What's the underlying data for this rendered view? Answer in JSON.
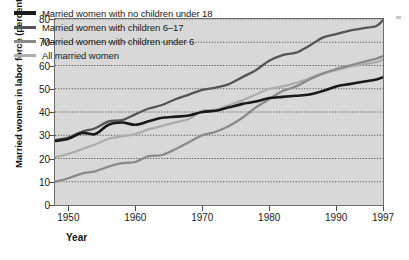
{
  "chart_data": {
    "type": "line",
    "title": "",
    "xlabel": "Year",
    "ylabel": "Married women in labor force (percent",
    "xlim": [
      1948,
      1997
    ],
    "ylim": [
      0,
      80
    ],
    "yticks": [
      0,
      10,
      20,
      30,
      40,
      50,
      60,
      70,
      80
    ],
    "xticks": [
      1950,
      1960,
      1970,
      1980,
      1990,
      1997
    ],
    "xtick_labels": [
      "1950",
      "1960",
      "1970",
      "1980",
      "1990",
      "1997"
    ],
    "grid": "horizontal-dotted",
    "legend_position": "top-left-inside",
    "plot_background": "#d8d8d8",
    "series": [
      {
        "name": "Married women with no children under 18",
        "color": "#1a1a1a",
        "x": [
          1948,
          1950,
          1952,
          1954,
          1956,
          1958,
          1960,
          1962,
          1964,
          1966,
          1968,
          1970,
          1972,
          1974,
          1976,
          1978,
          1980,
          1982,
          1984,
          1986,
          1988,
          1990,
          1992,
          1994,
          1996,
          1997
        ],
        "values": [
          27.5,
          28.5,
          31.0,
          30.5,
          34.5,
          35.5,
          34.5,
          36.0,
          37.5,
          38.0,
          38.5,
          40.0,
          40.5,
          42.0,
          43.5,
          44.5,
          46.0,
          46.5,
          47.0,
          47.5,
          49.0,
          51.0,
          52.0,
          53.0,
          54.0,
          55.0
        ]
      },
      {
        "name": "Married women with children 6–17",
        "color": "#555555",
        "x": [
          1948,
          1950,
          1952,
          1954,
          1956,
          1958,
          1960,
          1962,
          1964,
          1966,
          1968,
          1970,
          1972,
          1974,
          1976,
          1978,
          1980,
          1982,
          1984,
          1986,
          1988,
          1990,
          1992,
          1994,
          1996,
          1997
        ],
        "values": [
          28.0,
          29.0,
          31.5,
          33.0,
          36.0,
          36.5,
          39.0,
          41.5,
          43.0,
          45.5,
          47.5,
          49.5,
          50.5,
          52.0,
          55.0,
          58.0,
          62.0,
          64.5,
          65.5,
          68.5,
          72.0,
          73.5,
          75.0,
          76.0,
          77.0,
          79.5
        ]
      },
      {
        "name": "Married women with children under 6",
        "color": "#8a8a8a",
        "x": [
          1948,
          1950,
          1952,
          1954,
          1956,
          1958,
          1960,
          1962,
          1964,
          1966,
          1968,
          1970,
          1972,
          1974,
          1976,
          1978,
          1980,
          1982,
          1984,
          1986,
          1988,
          1990,
          1992,
          1994,
          1996,
          1997
        ],
        "values": [
          10.0,
          11.5,
          13.5,
          14.5,
          16.5,
          18.0,
          18.5,
          21.0,
          21.5,
          24.0,
          27.0,
          30.0,
          31.5,
          34.0,
          37.5,
          42.0,
          45.5,
          49.0,
          51.0,
          54.0,
          56.5,
          58.5,
          60.0,
          61.5,
          63.0,
          64.0
        ]
      },
      {
        "name": "All married women",
        "color": "#adadad",
        "x": [
          1948,
          1950,
          1952,
          1954,
          1956,
          1958,
          1960,
          1962,
          1964,
          1966,
          1968,
          1970,
          1972,
          1974,
          1976,
          1978,
          1980,
          1982,
          1984,
          1986,
          1988,
          1990,
          1992,
          1994,
          1996,
          1997
        ],
        "values": [
          20.5,
          22.0,
          24.0,
          26.0,
          28.5,
          29.5,
          30.5,
          32.5,
          34.0,
          35.5,
          37.0,
          40.5,
          41.0,
          43.0,
          45.0,
          47.5,
          50.0,
          51.0,
          52.5,
          54.5,
          56.5,
          58.0,
          59.5,
          60.5,
          61.5,
          62.5
        ]
      }
    ]
  }
}
